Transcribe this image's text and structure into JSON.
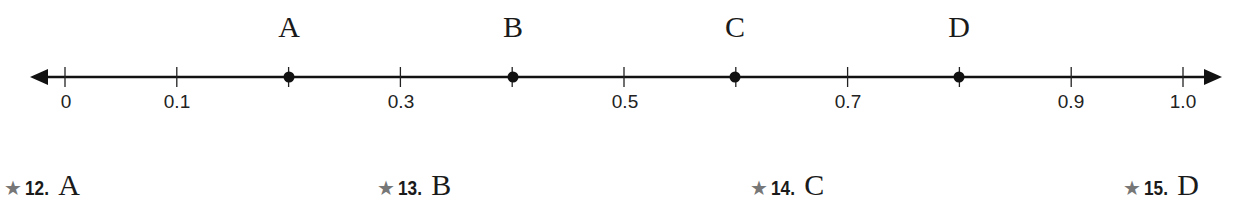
{
  "number_line": {
    "min": 0,
    "max": 1.0,
    "step": 0.1,
    "labeled_ticks": [
      {
        "value": 0,
        "label": "0",
        "x": 65
      },
      {
        "value": 0.1,
        "label": "0.1",
        "x": 177
      },
      {
        "value": 0.3,
        "label": "0.3",
        "x": 401
      },
      {
        "value": 0.5,
        "label": "0.5",
        "x": 625
      },
      {
        "value": 0.7,
        "label": "0.7",
        "x": 848
      },
      {
        "value": 0.9,
        "label": "0.9",
        "x": 1071
      },
      {
        "value": 1.0,
        "label": "1.0",
        "x": 1183
      }
    ],
    "points": [
      {
        "name": "A",
        "value": 0.2,
        "x": 289
      },
      {
        "name": "B",
        "value": 0.4,
        "x": 513
      },
      {
        "name": "C",
        "value": 0.6,
        "x": 735
      },
      {
        "name": "D",
        "value": 0.8,
        "x": 959
      }
    ]
  },
  "exercises": [
    {
      "star": "★",
      "number": "12.",
      "letter": "A",
      "x": 4
    },
    {
      "star": "★",
      "number": "13.",
      "letter": "B",
      "x": 377
    },
    {
      "star": "★",
      "number": "14.",
      "letter": "C",
      "x": 750
    },
    {
      "star": "★",
      "number": "15.",
      "letter": "D",
      "x": 1123
    }
  ]
}
